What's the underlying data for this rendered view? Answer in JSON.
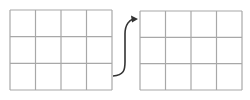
{
  "diagram": {
    "background": "#ffffff",
    "grid_line_color": "#a8a8a8",
    "arrow_color": "#333333",
    "grids": [
      {
        "name": "left-grid",
        "x": 10,
        "y": 10,
        "width": 102,
        "height": 80,
        "rows": 3,
        "cols": 4
      },
      {
        "name": "right-grid",
        "x": 140,
        "y": 11,
        "width": 102,
        "height": 79,
        "rows": 3,
        "cols": 4
      }
    ],
    "arrow": {
      "from": "left-grid",
      "to": "right-grid",
      "start": [
        113,
        76
      ],
      "end": [
        138,
        19
      ]
    }
  }
}
